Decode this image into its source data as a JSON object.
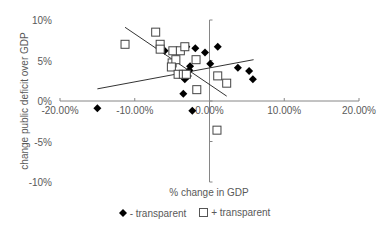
{
  "chart_data": {
    "type": "scatter",
    "title": "",
    "xlabel": "% change in GDP",
    "ylabel": "change public deficit over GDP",
    "xlim": [
      -20,
      20
    ],
    "ylim": [
      -10,
      10
    ],
    "x_ticks": [
      "-20.00%",
      "-10.00%",
      "0.00%",
      "10.00%",
      "20.00%"
    ],
    "y_ticks": [
      "10%",
      "5%",
      "0%",
      "-5%",
      "-10%"
    ],
    "grid": false,
    "legend_position": "bottom",
    "series": [
      {
        "name": "- transparent",
        "marker": "filled-diamond",
        "color": "#000000",
        "points": [
          [
            -15.0,
            -0.9
          ],
          [
            -2.3,
            -1.2
          ],
          [
            -6.0,
            6.2
          ],
          [
            -3.1,
            6.7
          ],
          [
            -1.9,
            6.5
          ],
          [
            -0.6,
            6.0
          ],
          [
            1.1,
            6.7
          ],
          [
            0.1,
            4.6
          ],
          [
            -2.6,
            4.3
          ],
          [
            -2.9,
            3.1
          ],
          [
            -3.3,
            2.7
          ],
          [
            -3.5,
            0.9
          ],
          [
            3.8,
            4.1
          ],
          [
            5.3,
            3.7
          ],
          [
            5.8,
            2.7
          ],
          [
            -2.7,
            3.8
          ]
        ],
        "trendline": [
          [
            -15.0,
            1.5
          ],
          [
            5.9,
            5.1
          ]
        ]
      },
      {
        "name": "+ transparent",
        "marker": "open-square",
        "color": "#000000",
        "points": [
          [
            -11.3,
            7.0
          ],
          [
            -7.2,
            8.5
          ],
          [
            -6.6,
            7.0
          ],
          [
            -6.6,
            6.4
          ],
          [
            -4.9,
            6.2
          ],
          [
            -3.9,
            6.2
          ],
          [
            -3.3,
            6.7
          ],
          [
            -5.0,
            4.7
          ],
          [
            -4.5,
            5.1
          ],
          [
            -5.1,
            4.2
          ],
          [
            -4.2,
            3.3
          ],
          [
            -3.5,
            3.3
          ],
          [
            -3.1,
            3.3
          ],
          [
            -1.8,
            5.1
          ],
          [
            -1.7,
            1.4
          ],
          [
            1.1,
            3.1
          ],
          [
            2.3,
            2.2
          ],
          [
            1.0,
            -3.6
          ]
        ],
        "trendline": [
          [
            -11.3,
            9.1
          ],
          [
            2.3,
            0.6
          ]
        ]
      }
    ]
  },
  "legend": {
    "items": [
      {
        "label": "- transparent",
        "marker": "filled-diamond"
      },
      {
        "label": "+ transparent",
        "marker": "open-square"
      }
    ]
  }
}
